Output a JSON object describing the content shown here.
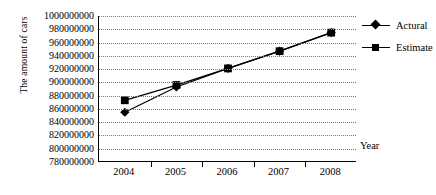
{
  "chart_data": {
    "type": "line",
    "title": "",
    "xlabel": "Year",
    "ylabel": "The amount of cars",
    "categories": [
      "2004",
      "2005",
      "2006",
      "2007",
      "2008"
    ],
    "ylim": [
      780000000,
      1000000000
    ],
    "ytick_step": 20000000,
    "ytick_labels": [
      "1000000000",
      "980000000",
      "960000000",
      "940000000",
      "920000000",
      "900000000",
      "880000000",
      "860000000",
      "840000000",
      "820000000",
      "800000000",
      "780000000"
    ],
    "ytick_values": [
      1000000000,
      980000000,
      960000000,
      940000000,
      920000000,
      900000000,
      880000000,
      860000000,
      840000000,
      820000000,
      800000000,
      780000000
    ],
    "grid": true,
    "grid_style": "dotted-horizontal",
    "legend_position": "right",
    "series": [
      {
        "name": "Actural",
        "marker": "diamond",
        "color": "#000000",
        "values": [
          855000000,
          893000000,
          921000000,
          947000000,
          975000000
        ]
      },
      {
        "name": "Estimate",
        "marker": "square",
        "color": "#000000",
        "values": [
          873000000,
          896000000,
          921000000,
          947000000,
          975000000
        ]
      }
    ]
  },
  "legend": {
    "items": [
      {
        "label": "Actural",
        "marker": "diamond"
      },
      {
        "label": "Estimate",
        "marker": "square"
      }
    ]
  },
  "axes": {
    "y_title": "The amount of cars",
    "x_title": "Year"
  }
}
